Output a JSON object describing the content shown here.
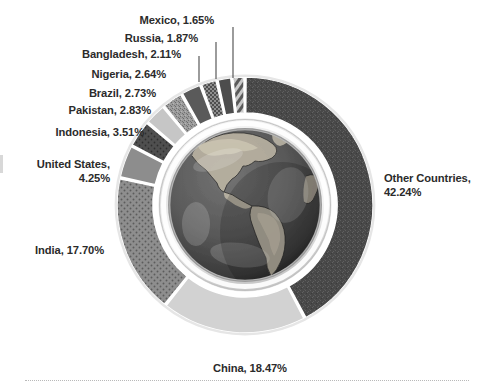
{
  "chart_data": {
    "type": "pie",
    "title": "",
    "subtitle": "",
    "xlabel": "",
    "ylabel": "",
    "legend_position": "outside-labels",
    "grid": false,
    "units": "percent",
    "start_angle_deg": 0,
    "direction": "clockwise",
    "center_image": "globe-americas",
    "categories": [
      "Other Countries",
      "China",
      "India",
      "United States",
      "Indonesia",
      "Pakistan",
      "Brazil",
      "Nigeria",
      "Bangladesh",
      "Russia",
      "Mexico"
    ],
    "values": [
      42.24,
      18.47,
      17.7,
      4.25,
      3.51,
      2.83,
      2.73,
      2.64,
      2.11,
      1.87,
      1.65
    ],
    "slices": [
      {
        "name": "Other Countries",
        "value": 42.24,
        "label": "Other Countries,\n42.24%",
        "color": "#4a4a4a",
        "pattern": "speckle",
        "label_align": "left",
        "leader": false
      },
      {
        "name": "China",
        "value": 18.47,
        "label": "China, 18.47%",
        "color": "#d2d2d2",
        "pattern": "solid",
        "label_align": "center",
        "leader": false
      },
      {
        "name": "India",
        "value": 17.7,
        "label": "India, 17.70%",
        "color": "#8a8a8a",
        "pattern": "dots",
        "label_align": "right",
        "leader": false
      },
      {
        "name": "United States",
        "value": 4.25,
        "label": "United States,\n4.25%",
        "color": "#8d8d8d",
        "pattern": "solid",
        "label_align": "right",
        "leader": false
      },
      {
        "name": "Indonesia",
        "value": 3.51,
        "label": "Indonesia, 3.51%",
        "color": "#4f4f4f",
        "pattern": "dots",
        "label_align": "right",
        "leader": false
      },
      {
        "name": "Pakistan",
        "value": 2.83,
        "label": "Pakistan, 2.83%",
        "color": "#c6c6c6",
        "pattern": "solid",
        "label_align": "right",
        "leader": false
      },
      {
        "name": "Brazil",
        "value": 2.73,
        "label": "Brazil, 2.73%",
        "color": "#9a9a9a",
        "pattern": "speckle",
        "label_align": "right",
        "leader": false
      },
      {
        "name": "Nigeria",
        "value": 2.64,
        "label": "Nigeria, 2.64%",
        "color": "#5a5a5a",
        "pattern": "solid",
        "label_align": "right",
        "leader": false
      },
      {
        "name": "Bangladesh",
        "value": 2.11,
        "label": "Bangladesh, 2.11%",
        "color": "#6f6f6f",
        "pattern": "checker",
        "label_align": "right",
        "leader": true
      },
      {
        "name": "Russia",
        "value": 1.87,
        "label": "Russia, 1.87%",
        "color": "#4d4d4d",
        "pattern": "solid",
        "label_align": "right",
        "leader": true
      },
      {
        "name": "Mexico",
        "value": 1.65,
        "label": "Mexico, 1.65%",
        "color": "#909090",
        "pattern": "diagonal",
        "label_align": "right",
        "leader": true
      }
    ]
  },
  "labels": {
    "mexico": "Mexico, 1.65%",
    "russia": "Russia, 1.87%",
    "bangladesh": "Bangladesh, 2.11%",
    "nigeria": "Nigeria, 2.64%",
    "brazil": "Brazil, 2.73%",
    "pakistan": "Pakistan, 2.83%",
    "indonesia": "Indonesia, 3.51%",
    "united_states": "United States,\n4.25%",
    "india": "India, 17.70%",
    "other_countries": "Other Countries,\n42.24%",
    "china": "China, 18.47%"
  },
  "colors": {
    "text": "#2b2b2b",
    "background": "#ffffff",
    "ring_gap": "#ffffff",
    "globe_rim": "#e8e8e8",
    "dark_slice": "#4a4a4a",
    "light_slice": "#d2d2d2"
  }
}
